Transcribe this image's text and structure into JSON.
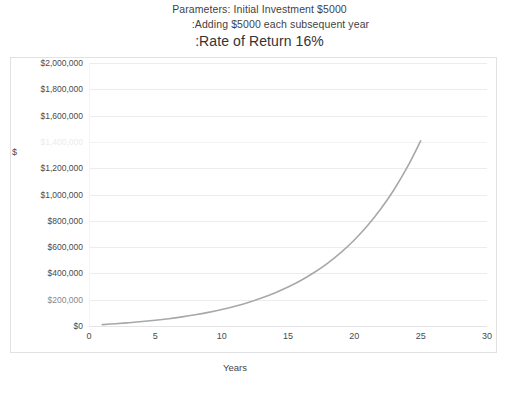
{
  "title": {
    "line1": "Parameters: Initial Investment $5000",
    "line2": ":Adding $5000 each subsequent year",
    "line3": ":Rate of Return 16%"
  },
  "axes": {
    "y_title": "$",
    "x_title": "Years",
    "y_ticks": [
      "$0",
      "$200,000",
      "$400,000",
      "$600,000",
      "$800,000",
      "$1,000,000",
      "$1,200,000",
      "$1,400,000",
      "$1,600,000",
      "$1,800,000",
      "$2,000,000"
    ],
    "x_ticks": [
      "0",
      "5",
      "10",
      "15",
      "20",
      "25",
      "30"
    ]
  },
  "colors": {
    "series": "#a8a8ab",
    "gridline": "#ececee",
    "frame": "#e2e2e4",
    "text": "#3a3a3a",
    "background": "#ffffff"
  },
  "chart_data": {
    "type": "line",
    "title": "Parameters: Initial Investment $5000 :Adding $5000 each subsequent year :Rate of Return 16%",
    "xlabel": "Years",
    "ylabel": "$",
    "xlim": [
      0,
      30
    ],
    "ylim": [
      0,
      2000000
    ],
    "xticks": [
      0,
      5,
      10,
      15,
      20,
      25,
      30
    ],
    "yticks": [
      0,
      200000,
      400000,
      600000,
      800000,
      1000000,
      1200000,
      1400000,
      1600000,
      1800000,
      2000000
    ],
    "grid": "horizontal",
    "legend": "none",
    "parameters": {
      "initial_investment": 5000,
      "annual_addition": 5000,
      "rate_of_return_percent": 16
    },
    "series": [
      {
        "name": "Portfolio Value",
        "color": "#a8a8ab",
        "x": [
          1,
          2,
          3,
          4,
          5,
          6,
          7,
          8,
          9,
          10,
          11,
          12,
          13,
          14,
          15,
          16,
          17,
          18,
          19,
          20,
          21,
          22,
          23,
          24,
          25
        ],
        "values": [
          10800,
          17328,
          24900,
          33684,
          43873,
          55693,
          69404,
          85309,
          103758,
          125159,
          149984,
          178781,
          212186,
          250936,
          295886,
          348028,
          408513,
          478675,
          560063,
          654473,
          763989,
          891027,
          1038391,
          1209334,
          1407628
        ]
      }
    ]
  }
}
